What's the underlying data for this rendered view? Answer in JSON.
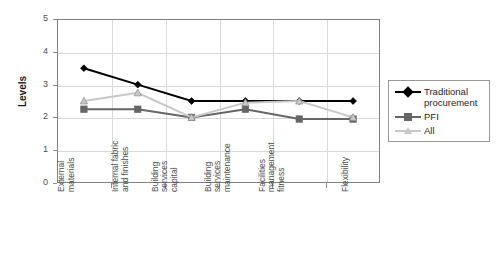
{
  "chart_data": {
    "type": "line",
    "title": "",
    "xlabel": "",
    "ylabel": "Levels",
    "ylim": [
      0,
      5
    ],
    "yticks": [
      "0",
      "1",
      "2",
      "3",
      "4",
      "5"
    ],
    "grid": true,
    "legend_position": "right",
    "categories": [
      "External\nmaterials",
      "Internal fabric\nand finishes",
      "Building\nservices\ncapital",
      "Building\nservices\nmaintenance",
      "Facilities\nmanagement\nfitness",
      "Flexibility"
    ],
    "series": [
      {
        "name": "Traditional procurement",
        "color": "#000000",
        "marker": "diamond",
        "values": [
          3.5,
          3.0,
          2.5,
          2.5,
          2.5,
          2.5
        ]
      },
      {
        "name": "PFI",
        "color": "#666666",
        "marker": "square",
        "values": [
          2.25,
          2.25,
          2.0,
          2.25,
          1.95,
          1.95
        ]
      },
      {
        "name": "All",
        "color": "#c8c8c8",
        "marker": "triangle",
        "values": [
          2.5,
          2.75,
          2.0,
          2.45,
          2.5,
          2.0
        ]
      }
    ]
  },
  "legend": {
    "entries": [
      {
        "label": "Traditional\nprocurement"
      },
      {
        "label": "PFI"
      },
      {
        "label": "All"
      }
    ]
  }
}
